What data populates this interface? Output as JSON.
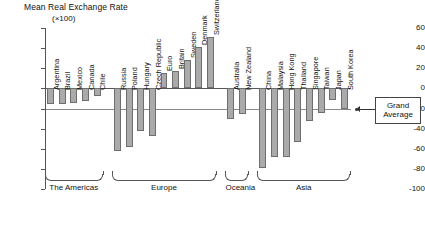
{
  "chart_data": {
    "type": "bar",
    "title": "Mean Real Exchange Rate",
    "subtitle": "(×100)",
    "xlabel": "",
    "ylabel": "",
    "ylim": [
      -100,
      60
    ],
    "ytick_step": 20,
    "ytick_labels": [
      "60",
      "40",
      "20",
      "0",
      "-20",
      "-40",
      "-60",
      "-80",
      "-100"
    ],
    "grid": false,
    "legend": false,
    "annotations": [
      {
        "name": "grand-average",
        "label_line1": "Grand",
        "label_line2": "Average",
        "value": -20
      }
    ],
    "groups": [
      {
        "name": "The Americas",
        "label": "The Americas"
      },
      {
        "name": "Europe",
        "label": "Europe"
      },
      {
        "name": "Oceania",
        "label": "Oceania"
      },
      {
        "name": "Asia",
        "label": "Asia"
      }
    ],
    "categories": [
      "Argentina",
      "Brazil",
      "Mexico",
      "Canada",
      "Chile",
      "Russia",
      "Poland",
      "Hungary",
      "Czech Republic",
      "Euro",
      "Britain",
      "Sweden",
      "Denmark",
      "Switzerland",
      "Australia",
      "New Zealand",
      "China",
      "Malaysia",
      "Hong Kong",
      "Thailand",
      "Singapore",
      "Taiwan",
      "Japan",
      "South Korea"
    ],
    "values": [
      -16,
      -16,
      -15,
      -13,
      -8,
      -62,
      -58,
      -42,
      -47,
      15,
      17,
      28,
      41,
      51,
      -30,
      -25,
      -79,
      -68,
      -68,
      -53,
      -32,
      -24,
      -12,
      -20
    ],
    "bars": [
      {
        "label": "Argentina",
        "value": -16,
        "group": "The Americas"
      },
      {
        "label": "Brazil",
        "value": -16,
        "group": "The Americas"
      },
      {
        "label": "Mexico",
        "value": -15,
        "group": "The Americas"
      },
      {
        "label": "Canada",
        "value": -13,
        "group": "The Americas"
      },
      {
        "label": "Chile",
        "value": -8,
        "group": "The Americas"
      },
      {
        "label": "Russia",
        "value": -62,
        "group": "Europe"
      },
      {
        "label": "Poland",
        "value": -58,
        "group": "Europe"
      },
      {
        "label": "Hungary",
        "value": -42,
        "group": "Europe"
      },
      {
        "label": "Czech Republic",
        "value": -47,
        "group": "Europe"
      },
      {
        "label": "Euro",
        "value": 15,
        "group": "Europe"
      },
      {
        "label": "Britain",
        "value": 17,
        "group": "Europe"
      },
      {
        "label": "Sweden",
        "value": 28,
        "group": "Europe"
      },
      {
        "label": "Denmark",
        "value": 41,
        "group": "Europe"
      },
      {
        "label": "Switzerland",
        "value": 51,
        "group": "Europe"
      },
      {
        "label": "Australia",
        "value": -30,
        "group": "Oceania"
      },
      {
        "label": "New Zealand",
        "value": -25,
        "group": "Oceania"
      },
      {
        "label": "China",
        "value": -79,
        "group": "Asia"
      },
      {
        "label": "Malaysia",
        "value": -68,
        "group": "Asia"
      },
      {
        "label": "Hong Kong",
        "value": -68,
        "group": "Asia"
      },
      {
        "label": "Thailand",
        "value": -53,
        "group": "Asia"
      },
      {
        "label": "Singapore",
        "value": -32,
        "group": "Asia"
      },
      {
        "label": "Taiwan",
        "value": -24,
        "group": "Asia"
      },
      {
        "label": "Japan",
        "value": -12,
        "group": "Asia"
      },
      {
        "label": "South Korea",
        "value": -20,
        "group": "Asia"
      }
    ],
    "colors": {
      "bar_fill": "#aaaaaa",
      "bar_stroke": "#6e6e6e",
      "axis": "#555555",
      "avg_line": "#8a8a8a"
    }
  }
}
